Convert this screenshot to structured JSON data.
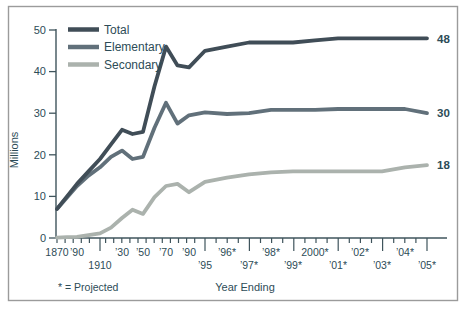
{
  "colors": {
    "text": "#2d4c57",
    "axis": "#3f545c",
    "total": "#404d57",
    "elementary": "#61707a",
    "secondary": "#abb2ad",
    "border": "#9b9b9b",
    "background": "#fdfdfb"
  },
  "figure": {
    "y_axis_title": "Millions",
    "x_axis_title": "Year Ending",
    "footnote": "* = Projected"
  },
  "chart_data": {
    "type": "line",
    "title": "",
    "ylabel": "Millions",
    "xlabel": "Year Ending",
    "ylim": [
      0,
      50
    ],
    "y_ticks": [
      0,
      10,
      20,
      30,
      40,
      50
    ],
    "grid": false,
    "legend_position": "top-left",
    "footnote": "* = Projected",
    "categories": [
      "1870",
      "1880",
      "1890",
      "1900",
      "1910",
      "1920",
      "1930",
      "1940",
      "1950",
      "1960",
      "1970",
      "1980",
      "1990",
      "1995",
      "1996",
      "1997",
      "1998",
      "1999",
      "2000",
      "2001",
      "2002",
      "2003",
      "2004",
      "2005"
    ],
    "x_tick_labels": [
      {
        "text": "1870",
        "row": 1
      },
      {
        "text": "",
        "row": 0
      },
      {
        "text": "’90",
        "row": 1
      },
      {
        "text": "",
        "row": 0
      },
      {
        "text": "1910",
        "row": 2
      },
      {
        "text": "",
        "row": 0
      },
      {
        "text": "’30",
        "row": 1
      },
      {
        "text": "",
        "row": 0
      },
      {
        "text": "’50",
        "row": 1
      },
      {
        "text": "",
        "row": 0
      },
      {
        "text": "’70",
        "row": 1
      },
      {
        "text": "",
        "row": 0
      },
      {
        "text": "’90",
        "row": 1
      },
      {
        "text": "’95",
        "row": 2
      },
      {
        "text": "’96*",
        "row": 1
      },
      {
        "text": "’97*",
        "row": 2
      },
      {
        "text": "’98*",
        "row": 1
      },
      {
        "text": "’99*",
        "row": 2
      },
      {
        "text": "2000*",
        "row": 1
      },
      {
        "text": "’01*",
        "row": 2
      },
      {
        "text": "’02*",
        "row": 1
      },
      {
        "text": "’03*",
        "row": 2
      },
      {
        "text": "’04*",
        "row": 1
      },
      {
        "text": "’05*",
        "row": 2
      }
    ],
    "series": [
      {
        "name": "Total",
        "color": "#404d57",
        "end_label": "48",
        "values": [
          7,
          10,
          13,
          16,
          19,
          22.5,
          26,
          25,
          25.5,
          36.5,
          46,
          41.5,
          41,
          45,
          46,
          47,
          47,
          47,
          47.5,
          48,
          48,
          48,
          48,
          48
        ]
      },
      {
        "name": "Elementary",
        "color": "#61707a",
        "end_label": "30",
        "values": [
          7,
          9.7,
          12.5,
          15,
          17,
          19.5,
          21,
          19,
          19.5,
          26.5,
          32.5,
          27.5,
          29.5,
          30.2,
          29.8,
          30,
          30.8,
          30.8,
          30.8,
          31,
          31,
          31,
          31,
          30
        ]
      },
      {
        "name": "Secondary",
        "color": "#abb2ad",
        "end_label": "18",
        "values": [
          0.1,
          0.2,
          0.3,
          0.7,
          1.1,
          2.5,
          4.8,
          6.8,
          5.8,
          9.8,
          12.5,
          13,
          11,
          13.5,
          14.5,
          15.3,
          15.8,
          16,
          16,
          16,
          16,
          16,
          17,
          17.5
        ]
      }
    ]
  }
}
